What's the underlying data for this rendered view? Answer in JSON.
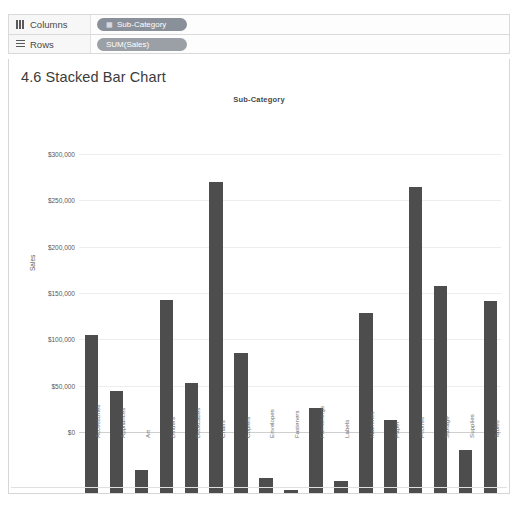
{
  "shelves": {
    "columns": {
      "label": "Columns",
      "icon": "columns-icon",
      "pill": {
        "text": "Sub-Category",
        "icon": "dimension-icon"
      }
    },
    "rows": {
      "label": "Rows",
      "icon": "rows-icon",
      "pill": {
        "text": "SUM(Sales)",
        "icon": ""
      }
    }
  },
  "sheet": {
    "title": "4.6 Stacked Bar Chart"
  },
  "colors": {
    "bar": "#4d4d4d",
    "grid": "#ededed",
    "pill_blue": "#8a9099",
    "pill_green": "#9aa0a6"
  },
  "chart_data": {
    "type": "bar",
    "title": "Sub-Category",
    "xlabel": "",
    "ylabel": "Sales",
    "ylim": [
      0,
      350000
    ],
    "grid": true,
    "legend": null,
    "ytick_labels": [
      "$0",
      "$50,000",
      "$100,000",
      "$150,000",
      "$200,000",
      "$250,000",
      "$300,000"
    ],
    "ytick_values": [
      0,
      50000,
      100000,
      150000,
      200000,
      250000,
      300000
    ],
    "categories": [
      "Accessories",
      "Appliances",
      "Art",
      "Binders",
      "Bookcases",
      "Chairs",
      "Copiers",
      "Envelopes",
      "Fasteners",
      "Furnishings",
      "Labels",
      "Machines",
      "Paper",
      "Phones",
      "Storage",
      "Supplies",
      "Tables"
    ],
    "values": [
      170500,
      110000,
      25000,
      208000,
      118500,
      335600,
      151000,
      16200,
      3000,
      91500,
      12500,
      194000,
      78500,
      330000,
      223000,
      46500,
      207000
    ]
  }
}
